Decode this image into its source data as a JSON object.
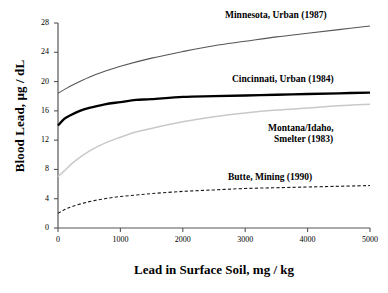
{
  "chart_data": {
    "type": "line",
    "title": "",
    "subtitle": "",
    "xlabel": "Lead in Surface Soil, mg / kg",
    "ylabel": "Blood Lead, µg / dL",
    "xlim": [
      0,
      5000
    ],
    "ylim": [
      0,
      28
    ],
    "xticks": [
      0,
      1000,
      2000,
      3000,
      4000,
      5000
    ],
    "yticks": [
      0,
      4,
      8,
      12,
      16,
      20,
      24,
      28
    ],
    "xtick_labels": [
      "0",
      "1000",
      "2000",
      "3000",
      "4000",
      "5000"
    ],
    "ytick_labels": [
      "0",
      "4",
      "8",
      "12",
      "16",
      "20",
      "24",
      "28"
    ],
    "grid": false,
    "legend_position": "inline-annotations",
    "series": [
      {
        "name": "Minnesota, Urban (1987)",
        "label_lines": [
          "Minnesota, Urban (1987)"
        ],
        "color": "#555555",
        "style": "solid",
        "width": 1.1,
        "x": [
          0,
          100,
          250,
          500,
          750,
          1000,
          1500,
          2000,
          2500,
          3000,
          3500,
          4000,
          4500,
          5000
        ],
        "y": [
          18.4,
          18.9,
          19.6,
          20.6,
          21.4,
          22.1,
          23.2,
          24.1,
          24.9,
          25.5,
          26.1,
          26.6,
          27.1,
          27.6
        ]
      },
      {
        "name": "Cincinnati, Urban (1984)",
        "label_lines": [
          "Cincinnati, Urban (1984)"
        ],
        "color": "#000000",
        "style": "solid",
        "width": 2.3,
        "x": [
          0,
          100,
          200,
          350,
          500,
          750,
          1000,
          1250,
          1500,
          2000,
          2500,
          3000,
          3500,
          4000,
          4500,
          5000
        ],
        "y": [
          14.0,
          14.9,
          15.4,
          16.0,
          16.4,
          16.9,
          17.2,
          17.5,
          17.6,
          17.9,
          18.0,
          18.1,
          18.2,
          18.3,
          18.4,
          18.5
        ]
      },
      {
        "name": "Montana/Idaho, Smelter (1983)",
        "label_lines": [
          "Montana/Idaho,",
          "Smelter (1983)"
        ],
        "color": "#c9c9c9",
        "style": "solid",
        "width": 1.5,
        "x": [
          0,
          100,
          250,
          500,
          750,
          1000,
          1250,
          1500,
          2000,
          2500,
          3000,
          3500,
          4000,
          4500,
          5000
        ],
        "y": [
          7.0,
          7.8,
          9.0,
          10.5,
          11.6,
          12.4,
          13.1,
          13.6,
          14.5,
          15.2,
          15.7,
          16.1,
          16.4,
          16.7,
          16.9
        ]
      },
      {
        "name": "Butte, Mining (1990)",
        "label_lines": [
          "Butte, Mining (1990)"
        ],
        "color": "#1a1a1a",
        "style": "dashed",
        "width": 1.1,
        "x": [
          0,
          100,
          250,
          500,
          750,
          1000,
          1250,
          1500,
          2000,
          2500,
          3000,
          3500,
          4000,
          4500,
          5000
        ],
        "y": [
          2.0,
          2.5,
          3.0,
          3.6,
          4.0,
          4.3,
          4.5,
          4.7,
          5.0,
          5.2,
          5.4,
          5.5,
          5.6,
          5.7,
          5.8
        ]
      }
    ],
    "annotations": [
      {
        "text": "Minnesota, Urban (1987)",
        "x_px": 225,
        "y_px": 10
      },
      {
        "text": "Cincinnati, Urban (1984)",
        "x_px": 232,
        "y_px": 74
      },
      {
        "text": "Montana/Idaho,",
        "x_px": 268,
        "y_px": 123
      },
      {
        "text": "Smelter (1983)",
        "x_px": 274,
        "y_px": 134
      },
      {
        "text": "Butte, Mining (1990)",
        "x_px": 228,
        "y_px": 172
      }
    ]
  },
  "axes": {
    "y_title": "Blood Lead, µg / dL",
    "x_title": "Lead in Surface Soil, mg / kg"
  },
  "colors": {
    "axis": "#555555",
    "background": "#ffffff",
    "minnesota": "#555555",
    "cincinnati": "#000000",
    "montana": "#c9c9c9",
    "butte": "#1a1a1a"
  }
}
